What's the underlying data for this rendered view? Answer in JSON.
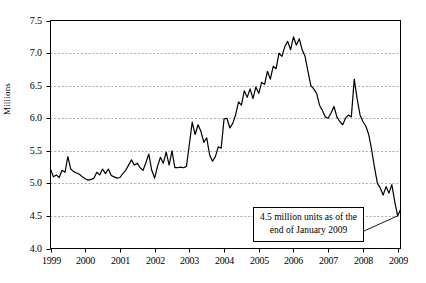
{
  "chart_data": {
    "type": "line",
    "title": "",
    "xlabel": "",
    "ylabel": "Millions",
    "ylim": [
      4.0,
      7.5
    ],
    "xlim": [
      1999.0,
      2009.083
    ],
    "yticks": [
      "7.5",
      "7.0",
      "6.5",
      "6.0",
      "5.5",
      "5.0",
      "4.5",
      "4.0"
    ],
    "ytick_values": [
      7.5,
      7.0,
      6.5,
      6.0,
      5.5,
      5.0,
      4.5,
      4.0
    ],
    "gridlines_at": [
      7.0,
      6.5,
      6.0,
      5.5,
      5.0,
      4.5
    ],
    "grid": "horizontal-dashed",
    "legend": "none",
    "xticks": [
      "1999",
      "2000",
      "2001",
      "2002",
      "2003",
      "2004",
      "2005",
      "2006",
      "2007",
      "2008",
      "2009"
    ],
    "xtick_values": [
      1999,
      2000,
      2001,
      2002,
      2003,
      2004,
      2005,
      2006,
      2007,
      2008,
      2009
    ],
    "line_color": "#000000",
    "series": [
      {
        "name": "Existing home inventory",
        "x": [
          1999.0,
          1999.083,
          1999.167,
          1999.25,
          1999.333,
          1999.417,
          1999.5,
          1999.583,
          1999.667,
          1999.75,
          1999.833,
          1999.917,
          2000.0,
          2000.083,
          2000.167,
          2000.25,
          2000.333,
          2000.417,
          2000.5,
          2000.583,
          2000.667,
          2000.75,
          2000.833,
          2000.917,
          2001.0,
          2001.083,
          2001.167,
          2001.25,
          2001.333,
          2001.417,
          2001.5,
          2001.583,
          2001.667,
          2001.75,
          2001.833,
          2001.917,
          2002.0,
          2002.083,
          2002.167,
          2002.25,
          2002.333,
          2002.417,
          2002.5,
          2002.583,
          2002.667,
          2002.75,
          2002.833,
          2002.917,
          2003.0,
          2003.083,
          2003.167,
          2003.25,
          2003.333,
          2003.417,
          2003.5,
          2003.583,
          2003.667,
          2003.75,
          2003.833,
          2003.917,
          2004.0,
          2004.083,
          2004.167,
          2004.25,
          2004.333,
          2004.417,
          2004.5,
          2004.583,
          2004.667,
          2004.75,
          2004.833,
          2004.917,
          2005.0,
          2005.083,
          2005.167,
          2005.25,
          2005.333,
          2005.417,
          2005.5,
          2005.583,
          2005.667,
          2005.75,
          2005.833,
          2005.917,
          2006.0,
          2006.083,
          2006.167,
          2006.25,
          2006.333,
          2006.417,
          2006.5,
          2006.583,
          2006.667,
          2006.75,
          2006.833,
          2006.917,
          2007.0,
          2007.083,
          2007.167,
          2007.25,
          2007.333,
          2007.417,
          2007.5,
          2007.583,
          2007.667,
          2007.75,
          2007.833,
          2007.917,
          2008.0,
          2008.083,
          2008.167,
          2008.25,
          2008.333,
          2008.417,
          2008.5,
          2008.583,
          2008.667,
          2008.75,
          2008.833,
          2008.917,
          2009.0,
          2009.083
        ],
        "values": [
          5.22,
          5.1,
          5.13,
          5.09,
          5.2,
          5.17,
          5.41,
          5.22,
          5.18,
          5.16,
          5.14,
          5.1,
          5.07,
          5.05,
          5.06,
          5.08,
          5.17,
          5.13,
          5.22,
          5.15,
          5.22,
          5.12,
          5.1,
          5.08,
          5.09,
          5.15,
          5.2,
          5.28,
          5.36,
          5.28,
          5.31,
          5.24,
          5.2,
          5.32,
          5.45,
          5.2,
          5.08,
          5.26,
          5.4,
          5.31,
          5.48,
          5.28,
          5.5,
          5.24,
          5.24,
          5.25,
          5.24,
          5.26,
          5.6,
          5.94,
          5.75,
          5.9,
          5.8,
          5.63,
          5.7,
          5.44,
          5.34,
          5.41,
          5.56,
          5.54,
          5.99,
          6.0,
          5.85,
          5.92,
          6.05,
          6.25,
          6.2,
          6.42,
          6.32,
          6.45,
          6.3,
          6.48,
          6.38,
          6.55,
          6.52,
          6.72,
          6.6,
          6.8,
          6.76,
          7.0,
          6.95,
          7.1,
          7.18,
          7.05,
          7.25,
          7.12,
          7.22,
          7.05,
          6.95,
          6.72,
          6.5,
          6.45,
          6.38,
          6.2,
          6.12,
          6.02,
          6.0,
          6.08,
          6.18,
          6.02,
          5.95,
          5.9,
          6.0,
          6.05,
          6.02,
          6.6,
          6.3,
          6.05,
          5.95,
          5.88,
          5.75,
          5.52,
          5.25,
          5.0,
          4.93,
          4.82,
          4.95,
          4.85,
          4.98,
          4.72,
          4.5,
          4.6
        ]
      }
    ],
    "annotation": {
      "line1": "4.5 million units as of the",
      "line2": "end of January 2009",
      "points_to_x": 2009.0,
      "points_to_y": 4.5
    }
  }
}
